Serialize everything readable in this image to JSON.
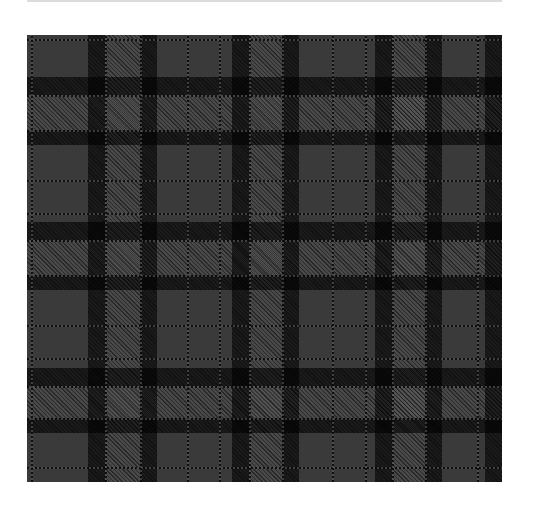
{
  "image": {
    "subject": "grey and black tartan plaid fabric swatch",
    "colors": {
      "base": "#3a3a3a",
      "dark_band": "#0a0a0a",
      "light_check": "#4a4a4a",
      "background": "#ffffff"
    },
    "swatch_bounds": {
      "x": 27,
      "y": 35,
      "width": 475,
      "height": 447
    },
    "pattern": {
      "vertical_dark_bands": [
        {
          "x": 61,
          "w": 17
        },
        {
          "x": 113,
          "w": 17
        },
        {
          "x": 205,
          "w": 17
        },
        {
          "x": 255,
          "w": 17
        },
        {
          "x": 348,
          "w": 17
        },
        {
          "x": 398,
          "w": 17
        },
        {
          "x": 458,
          "w": 17
        }
      ],
      "horizontal_dark_bands": [
        {
          "y": 42,
          "h": 18
        },
        {
          "y": 95,
          "h": 15
        },
        {
          "y": 187,
          "h": 18
        },
        {
          "y": 240,
          "h": 15
        },
        {
          "y": 333,
          "h": 18
        },
        {
          "y": 383,
          "h": 15
        }
      ],
      "vertical_mid_bands": [
        {
          "x": 78,
          "w": 35
        },
        {
          "x": 222,
          "w": 33
        },
        {
          "x": 365,
          "w": 33
        }
      ],
      "horizontal_mid_bands": [
        {
          "y": 60,
          "h": 35
        },
        {
          "y": 205,
          "h": 35
        },
        {
          "y": 351,
          "h": 32
        }
      ],
      "vertical_fine_lines": [
        4,
        78,
        113,
        160,
        192,
        222,
        255,
        305,
        338,
        365,
        398,
        450
      ],
      "horizontal_fine_lines": [
        4,
        60,
        95,
        145,
        178,
        205,
        240,
        290,
        323,
        351,
        383,
        432
      ]
    }
  }
}
